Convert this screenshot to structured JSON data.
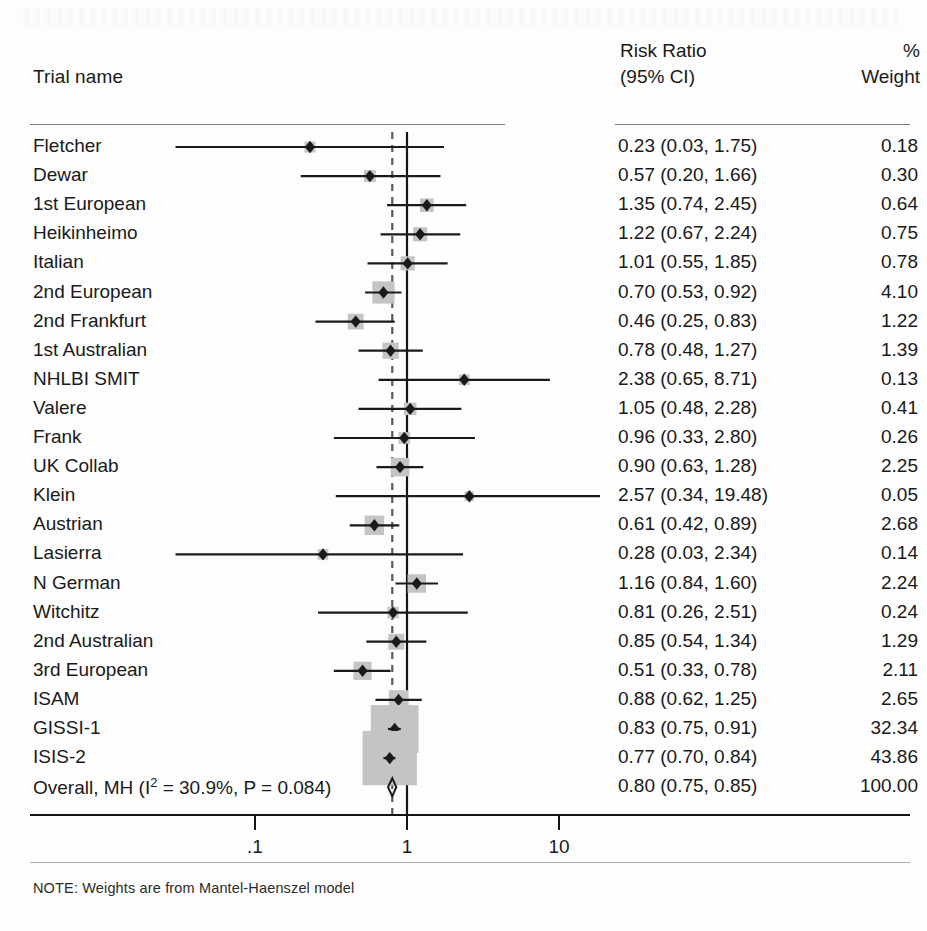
{
  "header": {
    "trial_col": "Trial name",
    "rr_line1": "Risk Ratio",
    "rr_line2": "(95% CI)",
    "weight_line1": "%",
    "weight_line2": "Weight"
  },
  "axis": {
    "ticks": [
      ".1",
      "1",
      "10"
    ],
    "tick_values": [
      0.1,
      1,
      10
    ],
    "scale": "log",
    "null_value": 1,
    "overall_line_value": 0.8
  },
  "note": "NOTE: Weights are from Mantel-Haenszel model",
  "overall_label_prefix": "Overall, MH (I",
  "overall_label_sup": "2",
  "overall_label_suffix": " = 30.9%, P = 0.084)",
  "colors": {
    "marker": "#1a1a1a",
    "weight_square": "#c4c4c4",
    "axis": "#141414",
    "rule": "#7d7d7d",
    "dashed_line": "#5a5a5a"
  },
  "chart_data": {
    "type": "forest",
    "title": "",
    "xlabel": "",
    "ylabel": "",
    "xscale": "log",
    "xlim": [
      0.02,
      25
    ],
    "grid": false,
    "legend": "none",
    "null_line": 1,
    "summary_line": 0.8,
    "columns": [
      "Trial name",
      "Risk Ratio (95% CI)",
      "% Weight"
    ],
    "rows": [
      {
        "name": "Fletcher",
        "rr": 0.23,
        "lo": 0.03,
        "hi": 1.75,
        "weight": 0.18,
        "rr_text": "0.23 (0.03, 1.75)",
        "weight_text": "0.18"
      },
      {
        "name": "Dewar",
        "rr": 0.57,
        "lo": 0.2,
        "hi": 1.66,
        "weight": 0.3,
        "rr_text": "0.57 (0.20, 1.66)",
        "weight_text": "0.30"
      },
      {
        "name": "1st European",
        "rr": 1.35,
        "lo": 0.74,
        "hi": 2.45,
        "weight": 0.64,
        "rr_text": "1.35 (0.74, 2.45)",
        "weight_text": "0.64"
      },
      {
        "name": "Heikinheimo",
        "rr": 1.22,
        "lo": 0.67,
        "hi": 2.24,
        "weight": 0.75,
        "rr_text": "1.22 (0.67, 2.24)",
        "weight_text": "0.75"
      },
      {
        "name": "Italian",
        "rr": 1.01,
        "lo": 0.55,
        "hi": 1.85,
        "weight": 0.78,
        "rr_text": "1.01 (0.55, 1.85)",
        "weight_text": "0.78"
      },
      {
        "name": "2nd European",
        "rr": 0.7,
        "lo": 0.53,
        "hi": 0.92,
        "weight": 4.1,
        "rr_text": "0.70 (0.53, 0.92)",
        "weight_text": "4.10"
      },
      {
        "name": "2nd Frankfurt",
        "rr": 0.46,
        "lo": 0.25,
        "hi": 0.83,
        "weight": 1.22,
        "rr_text": "0.46 (0.25, 0.83)",
        "weight_text": "1.22"
      },
      {
        "name": "1st Australian",
        "rr": 0.78,
        "lo": 0.48,
        "hi": 1.27,
        "weight": 1.39,
        "rr_text": "0.78 (0.48, 1.27)",
        "weight_text": "1.39"
      },
      {
        "name": "NHLBI SMIT",
        "rr": 2.38,
        "lo": 0.65,
        "hi": 8.71,
        "weight": 0.13,
        "rr_text": "2.38 (0.65, 8.71)",
        "weight_text": "0.13"
      },
      {
        "name": "Valere",
        "rr": 1.05,
        "lo": 0.48,
        "hi": 2.28,
        "weight": 0.41,
        "rr_text": "1.05 (0.48, 2.28)",
        "weight_text": "0.41"
      },
      {
        "name": "Frank",
        "rr": 0.96,
        "lo": 0.33,
        "hi": 2.8,
        "weight": 0.26,
        "rr_text": "0.96 (0.33, 2.80)",
        "weight_text": "0.26"
      },
      {
        "name": "UK Collab",
        "rr": 0.9,
        "lo": 0.63,
        "hi": 1.28,
        "weight": 2.25,
        "rr_text": "0.90 (0.63, 1.28)",
        "weight_text": "2.25"
      },
      {
        "name": "Klein",
        "rr": 2.57,
        "lo": 0.34,
        "hi": 19.48,
        "weight": 0.05,
        "rr_text": "2.57 (0.34, 19.48)",
        "weight_text": "0.05"
      },
      {
        "name": "Austrian",
        "rr": 0.61,
        "lo": 0.42,
        "hi": 0.89,
        "weight": 2.68,
        "rr_text": "0.61 (0.42, 0.89)",
        "weight_text": "2.68"
      },
      {
        "name": "Lasierra",
        "rr": 0.28,
        "lo": 0.03,
        "hi": 2.34,
        "weight": 0.14,
        "rr_text": "0.28 (0.03, 2.34)",
        "weight_text": "0.14"
      },
      {
        "name": "N German",
        "rr": 1.16,
        "lo": 0.84,
        "hi": 1.6,
        "weight": 2.24,
        "rr_text": "1.16 (0.84, 1.60)",
        "weight_text": "2.24"
      },
      {
        "name": "Witchitz",
        "rr": 0.81,
        "lo": 0.26,
        "hi": 2.51,
        "weight": 0.24,
        "rr_text": "0.81 (0.26, 2.51)",
        "weight_text": "0.24"
      },
      {
        "name": "2nd Australian",
        "rr": 0.85,
        "lo": 0.54,
        "hi": 1.34,
        "weight": 1.29,
        "rr_text": "0.85 (0.54, 1.34)",
        "weight_text": "1.29"
      },
      {
        "name": "3rd European",
        "rr": 0.51,
        "lo": 0.33,
        "hi": 0.78,
        "weight": 2.11,
        "rr_text": "0.51 (0.33, 0.78)",
        "weight_text": "2.11"
      },
      {
        "name": "ISAM",
        "rr": 0.88,
        "lo": 0.62,
        "hi": 1.25,
        "weight": 2.65,
        "rr_text": "0.88 (0.62, 1.25)",
        "weight_text": "2.65"
      },
      {
        "name": "GISSI-1",
        "rr": 0.83,
        "lo": 0.75,
        "hi": 0.91,
        "weight": 32.34,
        "rr_text": "0.83 (0.75, 0.91)",
        "weight_text": "32.34"
      },
      {
        "name": "ISIS-2",
        "rr": 0.77,
        "lo": 0.7,
        "hi": 0.84,
        "weight": 43.86,
        "rr_text": "0.77 (0.70, 0.84)",
        "weight_text": "43.86"
      }
    ],
    "summary": {
      "name": "Overall, MH (I2 = 30.9%, P = 0.084)",
      "rr": 0.8,
      "lo": 0.75,
      "hi": 0.85,
      "weight": 100.0,
      "rr_text": "0.80 (0.75, 0.85)",
      "weight_text": "100.00",
      "heterogeneity_i2": "30.9%",
      "p_value": "0.084"
    }
  }
}
